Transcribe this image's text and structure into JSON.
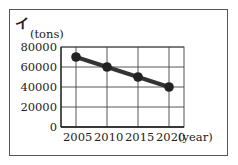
{
  "panel": {
    "label": "イ"
  },
  "chart_data": {
    "type": "line",
    "title": "",
    "panel_label": "イ",
    "xlabel": "(year)",
    "ylabel": "(tons)",
    "x": [
      2005,
      2010,
      2015,
      2020
    ],
    "categories": [
      "2005",
      "2010",
      "2015",
      "2020"
    ],
    "series": [
      {
        "name": "tons",
        "values": [
          70000,
          60000,
          50000,
          40000
        ],
        "color": "#333333",
        "marker": "circle"
      }
    ],
    "yticks": [
      "0",
      "20000",
      "40000",
      "60000",
      "80000"
    ],
    "ylim": [
      0,
      80000
    ],
    "grid": true,
    "legend": "none"
  }
}
